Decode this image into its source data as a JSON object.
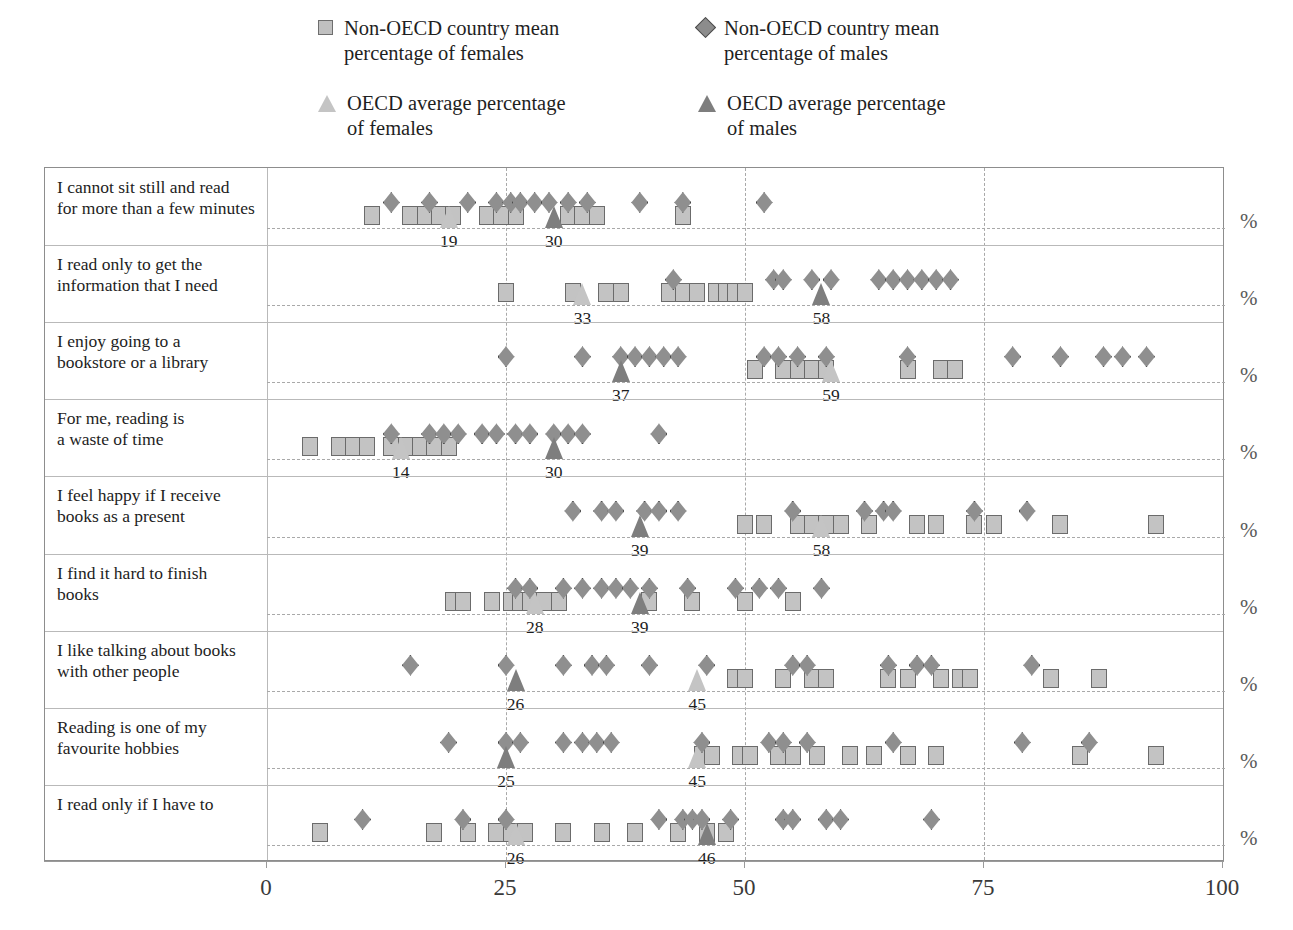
{
  "legend": {
    "items": [
      {
        "marker": "square-light",
        "label": "Non-OECD country mean\npercentage of females",
        "left": 0,
        "top": 8
      },
      {
        "marker": "diamond-dark",
        "label": "Non-OECD country mean\npercentage of males",
        "left": 380,
        "top": 8
      },
      {
        "marker": "triangle-light",
        "label": "OECD average percentage\nof females",
        "left": 0,
        "top": 83
      },
      {
        "marker": "triangle-dark",
        "label": "OECD average percentage\nof males",
        "left": 380,
        "top": 83
      }
    ]
  },
  "axis": {
    "ticks": [
      0,
      25,
      50,
      75,
      100
    ],
    "tick_labels": [
      "0",
      "25",
      "50",
      "75",
      "100"
    ],
    "xlim": [
      0,
      100
    ],
    "percent_symbol": "%"
  },
  "colors": {
    "female_marker_fill": "#c3c3c3",
    "female_marker_edge": "#6b6b6b",
    "male_marker_fill": "#8f8f8f",
    "male_marker_edge": "#474747",
    "female_avg_fill": "#c4c4c4",
    "male_avg_fill": "#7e7e7e",
    "grid": "#a9a9a9",
    "frame": "#8d8d8d"
  },
  "chart_data": {
    "type": "scatter",
    "title": "",
    "xlabel": "",
    "ylabel": "",
    "xlim": [
      0,
      100
    ],
    "grid": true,
    "legend_position": "top",
    "categories": [
      "I cannot sit still and read for more than a few minutes",
      "I read only to get the information that I need",
      "I enjoy going to a bookstore or a library",
      "For me, reading is a waste of time",
      "I feel happy if I receive books as a present",
      "I find it hard to finish books",
      "I like talking about books with other people",
      "Reading is one of my favourite hobbies",
      "I read only if I have to"
    ],
    "series": [
      {
        "name": "Non-OECD country mean percentage of females",
        "marker": "square-light"
      },
      {
        "name": "Non-OECD country mean percentage of males",
        "marker": "diamond-dark"
      },
      {
        "name": "OECD average percentage of females",
        "marker": "triangle-light"
      },
      {
        "name": "OECD average percentage of males",
        "marker": "triangle-dark"
      }
    ],
    "rows": [
      {
        "label_line1": "I cannot sit still and read",
        "label_line2": "for more than a few minutes",
        "females": [
          11,
          15,
          16.5,
          18,
          19.5,
          23,
          24.5,
          26,
          31.5,
          33,
          34.5,
          43.5
        ],
        "males": [
          13,
          17,
          21,
          24,
          25.5,
          26.5,
          28,
          29.5,
          31.5,
          33.5,
          39,
          43.5,
          52
        ],
        "oecd_female": 19,
        "oecd_male": 30,
        "pct": "%"
      },
      {
        "label_line1": "I read only to get the",
        "label_line2": "information that I need",
        "females": [
          25,
          32,
          35.5,
          37,
          42,
          43.5,
          45,
          47,
          48,
          49,
          50
        ],
        "males": [
          42.5,
          53,
          54,
          57,
          59,
          64,
          65.5,
          67,
          68.5,
          70,
          71.5
        ],
        "oecd_female": 33,
        "oecd_male": 58,
        "pct": "%"
      },
      {
        "label_line1": "I enjoy going to a",
        "label_line2": "bookstore or a library",
        "females": [
          51,
          54,
          55.5,
          57,
          58.5,
          67,
          70.5,
          72
        ],
        "males": [
          25,
          33,
          37,
          38.5,
          40,
          41.5,
          43,
          52,
          53.5,
          55.5,
          58.5,
          67,
          78,
          83,
          87.5,
          89.5,
          92
        ],
        "oecd_female": 59,
        "oecd_male": 37,
        "pct": "%"
      },
      {
        "label_line1": "For me, reading is",
        "label_line2": "a waste of time",
        "females": [
          4.5,
          7.5,
          9,
          10.5,
          13,
          14.5,
          16,
          17.5,
          19
        ],
        "males": [
          13,
          17,
          18.5,
          20,
          22.5,
          24,
          26,
          27.5,
          30,
          31.5,
          33,
          41
        ],
        "oecd_female": 14,
        "oecd_male": 30,
        "pct": "%"
      },
      {
        "label_line1": "I feel happy if I receive",
        "label_line2": "books as a present",
        "females": [
          50,
          52,
          55.5,
          57,
          58.5,
          60,
          63,
          68,
          70,
          74,
          76,
          83,
          93
        ],
        "males": [
          32,
          35,
          36.5,
          39.5,
          41,
          43,
          55,
          62.5,
          64.5,
          65.5,
          74,
          79.5
        ],
        "oecd_female": 58,
        "oecd_male": 39,
        "pct": "%"
      },
      {
        "label_line1": "I find it hard to finish",
        "label_line2": "books",
        "females": [
          19.5,
          20.5,
          23.5,
          25.5,
          26.5,
          27.5,
          29,
          30.5,
          40,
          44.5,
          50,
          55
        ],
        "males": [
          26,
          27.5,
          31,
          33,
          35,
          36.5,
          38,
          40,
          44,
          49,
          51.5,
          53.5,
          58
        ],
        "oecd_female": 28,
        "oecd_male": 39,
        "pct": "%"
      },
      {
        "label_line1": "I like talking about books",
        "label_line2": "with other people",
        "females": [
          49,
          50,
          54,
          57,
          58.5,
          65,
          67,
          70.5,
          72.5,
          73.5,
          82,
          87
        ],
        "males": [
          15,
          25,
          31,
          34,
          35.5,
          40,
          46,
          55,
          56.5,
          65,
          68,
          69.5,
          80
        ],
        "oecd_female": 45,
        "oecd_male": 26,
        "pct": "%"
      },
      {
        "label_line1": "Reading is one of my",
        "label_line2": "favourite hobbies",
        "females": [
          45.5,
          46.5,
          49.5,
          50.5,
          53.5,
          55,
          57.5,
          61,
          63.5,
          67,
          70,
          85,
          93
        ],
        "males": [
          19,
          25,
          26.5,
          31,
          33,
          34.5,
          36,
          45.5,
          52.5,
          54,
          56.5,
          65.5,
          79,
          86
        ],
        "oecd_female": 45,
        "oecd_male": 25,
        "pct": "%"
      },
      {
        "label_line1": "I read only if I have to",
        "label_line2": "",
        "females": [
          5.5,
          17.5,
          21,
          24,
          25.5,
          27,
          31,
          35,
          38.5,
          43,
          46,
          48
        ],
        "males": [
          10,
          20.5,
          25,
          41,
          43.5,
          44.5,
          45.5,
          48.5,
          54,
          55,
          58.5,
          60,
          69.5
        ],
        "oecd_female": 26,
        "oecd_male": 46,
        "pct": "%"
      }
    ]
  }
}
